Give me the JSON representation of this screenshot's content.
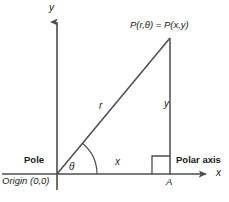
{
  "figure": {
    "background_color": "#ffffff",
    "stroke_color": "#4d4d4d",
    "text_color": "#1a1a1a",
    "width": 229,
    "height": 202
  },
  "labels": {
    "point_label": "P(r,θ) = P(x,y)",
    "y_axis": "y",
    "x_axis": "x",
    "radius": "r",
    "vertical_side": "y",
    "horizontal_side": "x",
    "angle": "θ",
    "foot_point": "A",
    "pole": "Pole",
    "polar_axis": "Polar axis",
    "origin": "Origin (0,0)"
  },
  "geometry": {
    "origin": {
      "x": 57,
      "y": 174
    },
    "point_P": {
      "x": 170,
      "y": 38
    },
    "foot_A": {
      "x": 170,
      "y": 174
    },
    "y_axis": {
      "x": 57,
      "y_top": 18,
      "y_bottom": 190
    },
    "x_axis": {
      "y": 174,
      "x_left": 2,
      "x_right": 212
    },
    "right_angle_box": {
      "x": 152,
      "y": 156,
      "size": 18
    },
    "angle_arc_radius": 40
  }
}
